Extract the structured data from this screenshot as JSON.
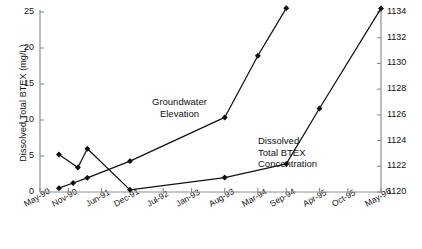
{
  "chart_data": {
    "type": "line",
    "title": "",
    "xlabel": "",
    "categories": [
      "May-90",
      "Nov-90",
      "Jun-91",
      "Dec-91",
      "Jul-92",
      "Jan-93",
      "Aug-93",
      "Mar-94",
      "Sep-94",
      "Apr-95",
      "Oct-95",
      "May-96"
    ],
    "grid": false,
    "legend": "annotations-in-plot",
    "axes": {
      "left": {
        "label": "Dissolved Total BTEX  (mg/L)",
        "ticks": [
          "0",
          "5",
          "10",
          "15",
          "20",
          "25"
        ],
        "tick_values": [
          0,
          5,
          10,
          15,
          20,
          25
        ],
        "ylim": [
          0,
          25
        ]
      },
      "right": {
        "label": "Groundwater Elevation (ft msl)",
        "ticks": [
          "1120",
          "1122",
          "1124",
          "1126",
          "1128",
          "1130",
          "1132",
          "1134"
        ],
        "tick_values": [
          1120,
          1122,
          1124,
          1126,
          1128,
          1130,
          1132,
          1134
        ],
        "ylim": [
          1120,
          1134
        ]
      }
    },
    "series": [
      {
        "name": "Dissolved Total BTEX Concentration",
        "axis": "left",
        "unit": "mg/L",
        "color": "#111111",
        "marker": "diamond",
        "points": [
          {
            "x": "Sep-90",
            "y": 5.2
          },
          {
            "x": "Jan-91",
            "y": 3.4
          },
          {
            "x": "Mar-91",
            "y": 6.0
          },
          {
            "x": "Dec-91",
            "y": 0.3
          },
          {
            "x": "Aug-93",
            "y": 2.0
          },
          {
            "x": "Sep-94",
            "y": 3.9
          },
          {
            "x": "Apr-95",
            "y": 11.6
          },
          {
            "x": "May-96",
            "y": 25.5
          }
        ]
      },
      {
        "name": "Groundwater Elevation",
        "axis": "right",
        "unit": "ft msl",
        "color": "#111111",
        "marker": "diamond",
        "points": [
          {
            "x": "Sep-90",
            "y": 1120.3
          },
          {
            "x": "Dec-90",
            "y": 1120.7
          },
          {
            "x": "Mar-91",
            "y": 1121.1
          },
          {
            "x": "Dec-91",
            "y": 1122.4
          },
          {
            "x": "Aug-93",
            "y": 1125.8
          },
          {
            "x": "Mar-94",
            "y": 1130.6
          },
          {
            "x": "Sep-94",
            "y": 1134.3
          }
        ]
      }
    ],
    "annotations": [
      {
        "name": "groundwater-elevation",
        "text": "Groundwater\nElevation"
      },
      {
        "name": "dissolved-total-btex",
        "text": "Dissolved\nTotal BTEX\nConcentration"
      }
    ]
  }
}
